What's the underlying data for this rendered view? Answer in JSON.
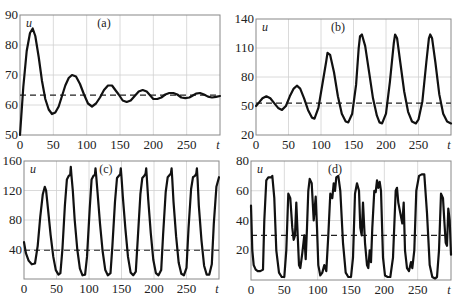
{
  "chart_data": [
    {
      "id": "a",
      "type": "line",
      "title": "(a)",
      "xlabel": "t",
      "ylabel": "u",
      "xlim": [
        0,
        300
      ],
      "ylim": [
        50,
        90
      ],
      "xticks": [
        0,
        50,
        100,
        150,
        200,
        250
      ],
      "yticks": [
        50,
        60,
        70,
        80,
        90
      ],
      "grid": true,
      "equilibrium": 63.3,
      "box": {
        "x0": 20,
        "x1": 220,
        "y0": 15,
        "y1": 135
      },
      "series": [
        {
          "name": "u(t)",
          "x": [
            0,
            5,
            10,
            15,
            19,
            23,
            28,
            33,
            38,
            43,
            48,
            53,
            58,
            63,
            68,
            73,
            78,
            84,
            90,
            96,
            102,
            108,
            114,
            120,
            126,
            132,
            138,
            143,
            148,
            154,
            160,
            166,
            172,
            178,
            184,
            190,
            196,
            200,
            206,
            212,
            218,
            224,
            230,
            236,
            242,
            248,
            254,
            258,
            264,
            270,
            276,
            282,
            288,
            294,
            300
          ],
          "y": [
            50,
            66,
            78,
            84,
            85.5,
            83,
            76,
            68,
            62,
            58.5,
            57,
            57.5,
            59.5,
            63,
            66.5,
            69,
            70,
            69.5,
            67,
            63.5,
            60.5,
            59.5,
            60.5,
            62.5,
            65,
            66.5,
            66.5,
            65,
            63.5,
            61.5,
            61,
            61.5,
            63,
            64.5,
            65,
            64.5,
            63,
            62,
            62,
            62.5,
            63.5,
            64,
            64,
            63.5,
            62.5,
            62.3,
            62.5,
            63,
            63.8,
            64,
            63.5,
            62.8,
            62.5,
            62.7,
            63
          ]
        }
      ]
    },
    {
      "id": "b",
      "type": "line",
      "title": "(b)",
      "xlabel": "t",
      "ylabel": "u",
      "xlim": [
        0,
        300
      ],
      "ylim": [
        20,
        140
      ],
      "xticks": [
        0,
        50,
        100,
        150,
        200,
        250
      ],
      "yticks": [
        20,
        50,
        80,
        110,
        140
      ],
      "grid": true,
      "equilibrium": 53,
      "box": {
        "x0": 256,
        "x1": 451,
        "y0": 19,
        "y1": 135
      },
      "series": [
        {
          "name": "u(t)",
          "x": [
            0,
            5,
            10,
            16,
            22,
            28,
            34,
            40,
            46,
            52,
            58,
            63,
            68,
            74,
            80,
            86,
            90,
            96,
            102,
            108,
            110,
            114,
            120,
            126,
            132,
            138,
            142,
            148,
            154,
            158,
            160,
            163,
            168,
            174,
            180,
            186,
            190,
            194,
            200,
            206,
            212,
            214,
            217,
            222,
            228,
            234,
            240,
            246,
            250,
            256,
            262,
            266,
            268,
            271,
            276,
            282,
            288,
            294,
            300
          ],
          "y": [
            50,
            54,
            58,
            60,
            58,
            53,
            48,
            46,
            50,
            60,
            68,
            71,
            68,
            58,
            46,
            38,
            37,
            48,
            72,
            96,
            105,
            103,
            85,
            60,
            42,
            34,
            33,
            42,
            72,
            110,
            122,
            124,
            112,
            85,
            58,
            40,
            33,
            32,
            42,
            75,
            115,
            124,
            120,
            95,
            65,
            44,
            34,
            32,
            36,
            55,
            95,
            120,
            124,
            120,
            95,
            62,
            42,
            34,
            32
          ]
        }
      ]
    },
    {
      "id": "c",
      "type": "line",
      "title": "(c)",
      "xlabel": "t",
      "ylabel": "u",
      "xlim": [
        0,
        300
      ],
      "ylim": [
        0,
        160
      ],
      "xticks": [
        0,
        50,
        100,
        150,
        200,
        250
      ],
      "yticks": [
        40,
        80,
        120,
        160
      ],
      "grid": true,
      "equilibrium": 39,
      "box": {
        "x0": 24,
        "x1": 219,
        "y0": 161,
        "y1": 279
      },
      "series": [
        {
          "name": "u(t)",
          "x": [
            0,
            3,
            7,
            12,
            17,
            21,
            25,
            29,
            32,
            34,
            37,
            41,
            45,
            49,
            53,
            56,
            59,
            63,
            66,
            69,
            71,
            72,
            73,
            75,
            78,
            82,
            86,
            90,
            94,
            97,
            101,
            104,
            107,
            109,
            110,
            111,
            113,
            117,
            121,
            125,
            129,
            133,
            136,
            140,
            143,
            146,
            148,
            149,
            150,
            152,
            156,
            160,
            164,
            168,
            172,
            175,
            179,
            182,
            185,
            187,
            188,
            189,
            191,
            195,
            199,
            203,
            207,
            211,
            214,
            218,
            221,
            224,
            226,
            227,
            228,
            230,
            234,
            238,
            242,
            246,
            250,
            253,
            257,
            260,
            263,
            265,
            266,
            267,
            269,
            273,
            277,
            281,
            285,
            289,
            292,
            296,
            300
          ],
          "y": [
            50,
            35,
            25,
            20,
            21,
            45,
            85,
            115,
            125,
            120,
            95,
            60,
            30,
            12,
            6,
            8,
            40,
            100,
            135,
            140,
            141,
            152,
            140,
            120,
            80,
            40,
            14,
            5,
            6,
            30,
            95,
            135,
            140,
            141,
            150,
            140,
            118,
            75,
            38,
            12,
            5,
            8,
            45,
            105,
            137,
            140,
            142,
            150,
            138,
            112,
            68,
            30,
            9,
            5,
            10,
            55,
            115,
            137,
            140,
            143,
            150,
            138,
            108,
            62,
            26,
            8,
            5,
            12,
            60,
            118,
            138,
            141,
            143,
            150,
            137,
            105,
            58,
            22,
            7,
            5,
            15,
            68,
            122,
            138,
            140,
            143,
            150,
            135,
            100,
            52,
            18,
            6,
            6,
            20,
            75,
            125,
            138
          ]
        }
      ]
    },
    {
      "id": "d",
      "type": "line",
      "title": "(d)",
      "xlabel": "t",
      "ylabel": "u",
      "xlim": [
        0,
        300
      ],
      "ylim": [
        0,
        80
      ],
      "xticks": [
        0,
        50,
        100,
        150,
        200,
        250
      ],
      "yticks": [
        20,
        40,
        60,
        80
      ],
      "grid": true,
      "equilibrium": 30,
      "box": {
        "x0": 251,
        "x1": 451,
        "y0": 161,
        "y1": 280
      },
      "series": [
        {
          "name": "u(t)",
          "x": [
            0,
            2,
            4,
            7,
            10,
            14,
            18,
            20,
            23,
            26,
            30,
            32,
            35,
            38,
            42,
            46,
            50,
            53,
            56,
            59,
            62,
            64,
            66,
            68,
            70,
            72,
            74,
            77,
            80,
            82,
            84,
            86,
            88,
            91,
            94,
            97,
            99,
            101,
            104,
            107,
            110,
            113,
            116,
            119,
            122,
            124,
            126,
            128,
            131,
            134,
            138,
            142,
            146,
            150,
            153,
            156,
            159,
            162,
            164,
            166,
            168,
            171,
            174,
            176,
            178,
            180,
            182,
            185,
            187,
            189,
            191,
            193,
            195,
            198,
            201,
            205,
            209,
            213,
            217,
            219,
            221,
            224,
            227,
            229,
            231,
            234,
            237,
            240,
            242,
            245,
            248,
            252,
            256,
            260,
            264,
            268,
            272,
            276,
            279,
            282,
            285,
            288,
            290,
            292,
            294,
            296,
            298,
            300
          ],
          "y": [
            50,
            20,
            10,
            7,
            6,
            6,
            7,
            40,
            67,
            69,
            69,
            70,
            55,
            20,
            5,
            2,
            2,
            20,
            58,
            55,
            35,
            27,
            30,
            52,
            30,
            10,
            8,
            18,
            30,
            14,
            35,
            60,
            68,
            65,
            40,
            56,
            35,
            10,
            3,
            5,
            10,
            6,
            30,
            58,
            55,
            65,
            60,
            69,
            70,
            60,
            25,
            5,
            2,
            2,
            15,
            58,
            65,
            60,
            35,
            30,
            52,
            25,
            10,
            8,
            20,
            12,
            35,
            60,
            59,
            67,
            62,
            66,
            60,
            15,
            3,
            2,
            2,
            15,
            60,
            62,
            52,
            45,
            38,
            52,
            20,
            8,
            6,
            12,
            8,
            20,
            60,
            70,
            71,
            71,
            45,
            10,
            2,
            1,
            2,
            20,
            58,
            55,
            40,
            25,
            23,
            48,
            40,
            17
          ]
        }
      ]
    }
  ]
}
